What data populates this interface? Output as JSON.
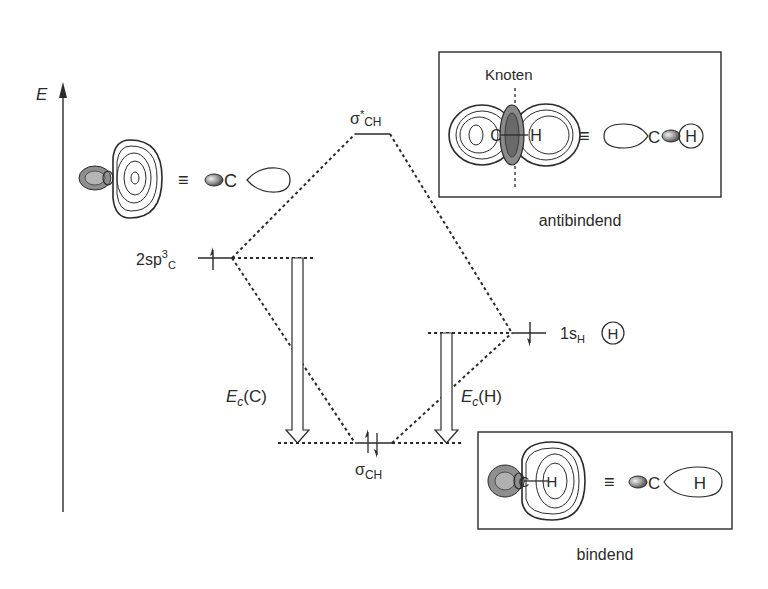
{
  "axis": {
    "label": "E"
  },
  "levels": {
    "carbon": {
      "label_main": "2sp",
      "label_sup": "3",
      "label_sub": "C",
      "electrons": "up"
    },
    "hydrogen": {
      "label_main": "1s",
      "label_sub": "H",
      "atom": "H",
      "electrons": "down"
    },
    "antibonding": {
      "label_main": "σ",
      "label_sup": "*",
      "label_sub": "CH"
    },
    "bonding": {
      "label_main": "σ",
      "label_sub": "CH",
      "electrons": "pair"
    }
  },
  "energy_arrows": {
    "carbon": {
      "label_main": "E",
      "label_sub": "c",
      "label_rest": "(C)"
    },
    "hydrogen": {
      "label_main": "E",
      "label_sub": "c",
      "label_rest": "(H)"
    }
  },
  "hybrid_orbital": {
    "equiv": "≡",
    "atom": "C"
  },
  "antibonding_box": {
    "node_label": "Knoten",
    "equiv": "≡",
    "atom_c": "C",
    "atom_h": "H",
    "contour_atoms": [
      "C",
      "H"
    ],
    "caption": "antibindend"
  },
  "bonding_box": {
    "equiv": "≡",
    "atom_c": "C",
    "atom_h": "H",
    "contour_atoms": [
      "C",
      "H"
    ],
    "caption": "bindend"
  },
  "colors": {
    "ink": "#2a2a2a",
    "shade": "#8a8a8a",
    "shade_light": "#bdbdbd",
    "background": "#ffffff"
  }
}
